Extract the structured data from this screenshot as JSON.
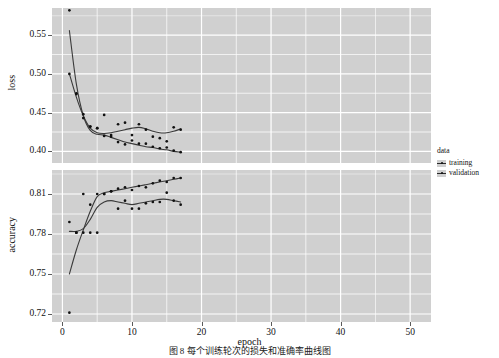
{
  "chart_data": {
    "type": "line",
    "title": "",
    "subtitle": "",
    "xlabel": "epoch",
    "facets": [
      {
        "name": "loss",
        "ylabel": "loss",
        "yticks": [
          0.4,
          0.45,
          0.5,
          0.55
        ],
        "ytick_labels": [
          "0.40",
          "0.45",
          "0.50",
          "0.55"
        ],
        "ylim": [
          0.385,
          0.585
        ],
        "series": [
          {
            "name": "training",
            "x": [
              1,
              2,
              3,
              4,
              5,
              6,
              7,
              8,
              9,
              10,
              11,
              12,
              13,
              14,
              15,
              16,
              17
            ],
            "y": [
              0.582,
              0.475,
              0.443,
              0.432,
              0.43,
              0.42,
              0.419,
              0.412,
              0.409,
              0.414,
              0.41,
              0.41,
              0.406,
              0.404,
              0.405,
              0.401,
              0.399
            ],
            "smooth_y": [
              0.556,
              0.487,
              0.446,
              0.427,
              0.422,
              0.421,
              0.418,
              0.415,
              0.412,
              0.41,
              0.408,
              0.406,
              0.405,
              0.403,
              0.402,
              0.4,
              0.399
            ]
          },
          {
            "name": "validation",
            "x": [
              1,
              2,
              3,
              4,
              5,
              6,
              7,
              8,
              9,
              10,
              11,
              12,
              13,
              14,
              15,
              16,
              17
            ],
            "y": [
              0.5,
              0.474,
              0.448,
              0.432,
              0.43,
              0.447,
              0.421,
              0.435,
              0.437,
              0.421,
              0.435,
              0.428,
              0.419,
              0.417,
              0.413,
              0.431,
              0.428
            ],
            "smooth_y": [
              0.5,
              0.47,
              0.446,
              0.43,
              0.424,
              0.423,
              0.424,
              0.426,
              0.428,
              0.43,
              0.431,
              0.429,
              0.426,
              0.424,
              0.424,
              0.426,
              0.429
            ]
          }
        ]
      },
      {
        "name": "accuracy",
        "ylabel": "accuracy",
        "yticks": [
          0.72,
          0.75,
          0.78,
          0.81
        ],
        "ytick_labels": [
          "0.72",
          "0.75",
          "0.78",
          "0.81"
        ],
        "ylim": [
          0.714,
          0.828
        ],
        "series": [
          {
            "name": "training",
            "x": [
              1,
              2,
              3,
              4,
              5,
              6,
              7,
              8,
              9,
              10,
              11,
              12,
              13,
              14,
              15,
              16,
              17
            ],
            "y": [
              0.721,
              0.781,
              0.781,
              0.781,
              0.781,
              0.81,
              0.812,
              0.814,
              0.815,
              0.813,
              0.816,
              0.815,
              0.818,
              0.82,
              0.819,
              0.822,
              0.822
            ],
            "smooth_y": [
              0.75,
              0.768,
              0.783,
              0.797,
              0.808,
              0.811,
              0.812,
              0.813,
              0.814,
              0.815,
              0.816,
              0.817,
              0.818,
              0.819,
              0.82,
              0.821,
              0.822
            ]
          },
          {
            "name": "validation",
            "x": [
              1,
              2,
              3,
              4,
              5,
              6,
              7,
              8,
              9,
              10,
              11,
              12,
              13,
              14,
              15,
              16,
              17
            ],
            "y": [
              0.789,
              0.781,
              0.81,
              0.802,
              0.81,
              0.81,
              0.812,
              0.799,
              0.805,
              0.799,
              0.799,
              0.803,
              0.804,
              0.804,
              0.811,
              0.805,
              0.802
            ],
            "smooth_y": [
              0.782,
              0.782,
              0.784,
              0.791,
              0.8,
              0.804,
              0.805,
              0.804,
              0.803,
              0.802,
              0.803,
              0.804,
              0.805,
              0.806,
              0.806,
              0.805,
              0.804
            ]
          }
        ]
      }
    ],
    "xticks": [
      0,
      10,
      20,
      30,
      40,
      50
    ],
    "xtick_labels": [
      "0",
      "10",
      "20",
      "30",
      "40",
      "50"
    ],
    "xlim": [
      -1.5,
      53
    ],
    "grid": true,
    "legend": {
      "title": "data",
      "position": "right",
      "entries": [
        "training",
        "validation"
      ]
    },
    "colors": {
      "panel_background": "#d0d0d0",
      "gridline": "#ffffff",
      "point": "#111111",
      "smooth_line": "#3a3a3a",
      "text": "#111111"
    }
  },
  "axes": {
    "xlabel": "epoch",
    "loss_ylabel": "loss",
    "accuracy_ylabel": "accuracy"
  },
  "legend": {
    "title": "data",
    "training_label": "training",
    "validation_label": "validation"
  },
  "caption": {
    "text": "图 8  每个训练轮次的损失和准确率曲线图"
  }
}
